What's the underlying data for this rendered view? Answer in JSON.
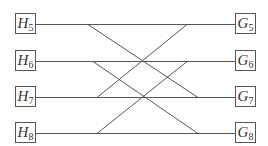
{
  "diagram": {
    "type": "bipartite-wiring",
    "left_nodes": [
      {
        "id": "H5",
        "letter": "H",
        "sub": "5",
        "x": 15,
        "y": 13
      },
      {
        "id": "H6",
        "letter": "H",
        "sub": "6",
        "x": 15,
        "y": 50
      },
      {
        "id": "H7",
        "letter": "H",
        "sub": "7",
        "x": 15,
        "y": 86
      },
      {
        "id": "H8",
        "letter": "H",
        "sub": "8",
        "x": 15,
        "y": 122
      }
    ],
    "right_nodes": [
      {
        "id": "G5",
        "letter": "G",
        "sub": "5",
        "x": 235,
        "y": 13
      },
      {
        "id": "G6",
        "letter": "G",
        "sub": "6",
        "x": 235,
        "y": 50
      },
      {
        "id": "G7",
        "letter": "G",
        "sub": "7",
        "x": 235,
        "y": 86
      },
      {
        "id": "G8",
        "letter": "G",
        "sub": "8",
        "x": 235,
        "y": 122
      }
    ],
    "horizontal_edges": [
      {
        "from": "H5",
        "to": "G5",
        "y": 24
      },
      {
        "from": "H6",
        "to": "G6",
        "y": 61
      },
      {
        "from": "H7",
        "to": "G7",
        "y": 97
      },
      {
        "from": "H8",
        "to": "G8",
        "y": 133
      }
    ],
    "diagonal_edges": [
      {
        "from": "H5",
        "to": "G7",
        "x1": 88,
        "y1": 24,
        "x2": 198,
        "y2": 97
      },
      {
        "from": "H7",
        "to": "G5",
        "x1": 97,
        "y1": 97,
        "x2": 187,
        "y2": 24
      },
      {
        "from": "H6",
        "to": "G8",
        "x1": 93,
        "y1": 61,
        "x2": 198,
        "y2": 133
      },
      {
        "from": "H8",
        "to": "G6",
        "x1": 97,
        "y1": 133,
        "x2": 187,
        "y2": 61
      }
    ],
    "line_color": "#555555"
  }
}
